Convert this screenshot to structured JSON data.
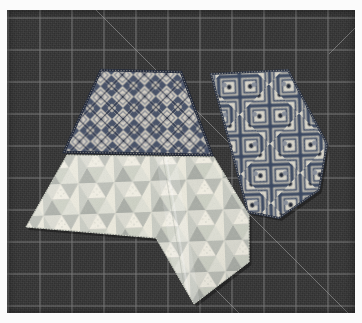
{
  "scene": {
    "title": "Three cut fabric pieces on a dark self-healing cutting mat",
    "description": "Overhead photograph of a quilting layout: a dark blue-and-cream diamond-lattice trapezoid at upper left, a matching diamond-lattice kite shape at right, and a pale pastel triangle-patterned irregular polygon across the lower left.",
    "canvas": {
      "width": 362,
      "height": 323
    }
  },
  "background": {
    "name": "cutting-mat",
    "color": "#3b3b3b",
    "grid_line_color": "#8f8f8f",
    "grid_spacing_px": 32,
    "grid_origin": {
      "x": 8,
      "y": 18
    },
    "border_color": "#fbfbfb",
    "mat_rect": {
      "x": 7,
      "y": 10,
      "width": 348,
      "height": 303
    },
    "diagonals": [
      {
        "name": "diagonal-45-upper-left",
        "x1": 96,
        "y1": 10,
        "x2": 232,
        "y2": 146
      },
      {
        "name": "diagonal-45-lower-right",
        "x1": 242,
        "y1": 206,
        "x2": 355,
        "y2": 319
      },
      {
        "name": "diagonal-45-lower-left",
        "x1": 150,
        "y1": 222,
        "x2": 252,
        "y2": 324
      },
      {
        "name": "diagonal-135-top-right",
        "x1": 355,
        "y1": 30,
        "x2": 330,
        "y2": 55
      }
    ]
  },
  "pieces": [
    {
      "id": "piece-trapezoid-top-left",
      "name": "diamond-lattice-trapezoid",
      "pattern": "diamond-lattice",
      "shape": "trapezoid",
      "bbox": {
        "x": 62,
        "y": 69,
        "width": 152,
        "height": 90
      },
      "points": "101,70 181,72 212,155 64,152",
      "colors": {
        "light": "#e9e3d6",
        "mid": "#b9bcc4",
        "dark": "#3e4a63",
        "accent": "#1d2433",
        "edge": "#2b3040"
      }
    },
    {
      "id": "piece-kite-right",
      "name": "diamond-lattice-kite",
      "pattern": "diamond-lattice",
      "shape": "kite",
      "bbox": {
        "x": 208,
        "y": 68,
        "width": 120,
        "height": 152
      },
      "points": "211,74 288,70 327,144 319,190 279,218 248,212",
      "colors": {
        "light": "#ece7da",
        "mid": "#b6b9c1",
        "dark": "#424d66",
        "accent": "#1b2130",
        "edge": "#2b3040"
      }
    },
    {
      "id": "piece-polygon-bottom",
      "name": "pastel-triangle-polygon",
      "pattern": "triangle-tessellation",
      "shape": "irregular-polygon",
      "bbox": {
        "x": 24,
        "y": 152,
        "width": 226,
        "height": 152
      },
      "points": "67,155 214,157 249,215 249,262 194,304 156,238 26,227",
      "colors": {
        "cream": "#f2efe2",
        "pale": "#e4e4db",
        "gray": "#c4c6c0",
        "mid_gray": "#a9aca6",
        "sage": "#cdd2c3",
        "shadow": "#9ba09a"
      }
    }
  ]
}
